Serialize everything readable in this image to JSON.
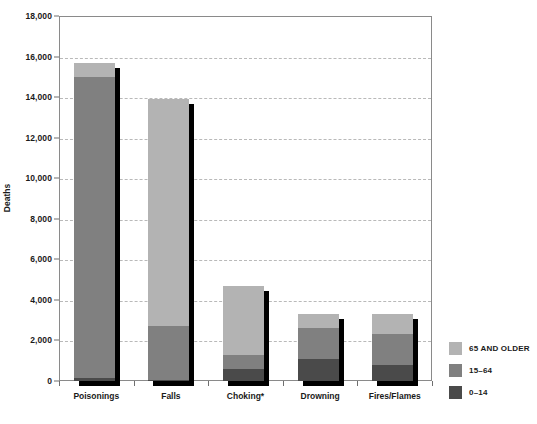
{
  "chart_data": {
    "type": "bar",
    "subtype": "stacked-vertical",
    "title": "",
    "xlabel": "",
    "ylabel": "Deaths",
    "ylim": [
      0,
      18000
    ],
    "ytick_labels": [
      "0",
      "2,000",
      "4,000",
      "6,000",
      "8,000",
      "10,000",
      "12,000",
      "14,000",
      "16,000",
      "18,000"
    ],
    "ytick_values": [
      0,
      2000,
      4000,
      6000,
      8000,
      10000,
      12000,
      14000,
      16000,
      18000
    ],
    "grid": true,
    "grid_style": "dashed-horizontal",
    "legend_position": "right",
    "categories": [
      "Poisonings",
      "Falls",
      "Choking*",
      "Drowning",
      "Fires/Flames"
    ],
    "series": [
      {
        "name": "0–14",
        "values": [
          150,
          40,
          600,
          1100,
          800
        ],
        "color": "#4a4a4a"
      },
      {
        "name": "15–64",
        "values": [
          14850,
          2660,
          700,
          1500,
          1500
        ],
        "color": "#808080"
      },
      {
        "name": "65 AND OLDER",
        "values": [
          700,
          11200,
          3400,
          700,
          1000
        ],
        "color": "#b3b3b3"
      }
    ],
    "totals": [
      15700,
      13900,
      4700,
      3300,
      3300
    ],
    "shadow_color": "#000000",
    "axis_color": "#8a8a8a",
    "text_color": "#1a1a1a"
  },
  "legend": {
    "items": [
      {
        "label": "65 AND OLDER",
        "color": "#b3b3b3"
      },
      {
        "label": "15–64",
        "color": "#808080"
      },
      {
        "label": "0–14",
        "color": "#4a4a4a"
      }
    ]
  },
  "axes": {
    "y_title": "Deaths"
  }
}
